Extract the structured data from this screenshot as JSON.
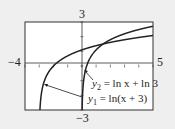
{
  "chart_data": {
    "type": "line",
    "title": "",
    "xlabel": "",
    "ylabel": "",
    "xlim": [
      -4,
      5
    ],
    "ylim": [
      -3,
      3
    ],
    "grid": false,
    "tick_labels": {
      "x_min": "−4",
      "x_max": "5",
      "y_max": "3",
      "y_min": "−3"
    },
    "series": [
      {
        "name": "y1 = ln(x + 3)",
        "function": "ln(x+3)",
        "domain": [
          -3,
          5
        ]
      },
      {
        "name": "y2 = ln x + ln 3",
        "function": "ln(x)+ln(3)",
        "domain": [
          0,
          5
        ]
      }
    ],
    "annotations": [
      {
        "text": "y2 = ln x + ln 3",
        "points_to": "y2 near x≈0.2"
      },
      {
        "text": "y1 = ln(x + 3)",
        "points_to": "y1 near x≈-2.7"
      }
    ],
    "intersection": {
      "x": 1.5,
      "y": 1.5
    }
  },
  "labels": {
    "y_top": "3",
    "y_bottom": "−3",
    "x_left": "−4",
    "x_right": "5",
    "y2_prefix": "y",
    "y2_sub": "2",
    "y2_rest": " = ln x + ln 3",
    "y1_prefix": "y",
    "y1_sub": "1",
    "y1_rest": " = ln(x + 3)"
  }
}
